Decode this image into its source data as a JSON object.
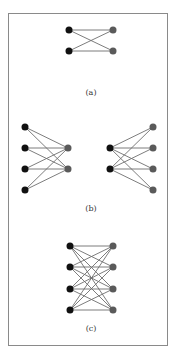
{
  "colors": {
    "left_node": "#111111",
    "right_node": "#5a5a5a",
    "edge": "#6e6e6e",
    "border": "#8a8a8a"
  },
  "panels": [
    {
      "label": "(a)",
      "label_pos": [
        91,
        95
      ],
      "left_nodes": [
        [
          69,
          30
        ],
        [
          69,
          51
        ]
      ],
      "right_nodes": [
        [
          113,
          30
        ],
        [
          113,
          51
        ]
      ],
      "edges": "complete"
    },
    {
      "label": "(b)",
      "label_pos": [
        91,
        211
      ],
      "subgraphs": [
        {
          "left_nodes": [
            [
              25,
              127
            ],
            [
              25,
              148
            ],
            [
              25,
              169
            ],
            [
              25,
              190
            ]
          ],
          "right_nodes": [
            [
              68,
              148
            ],
            [
              68,
              169
            ]
          ],
          "edges": "complete"
        },
        {
          "left_nodes": [
            [
              110,
              148
            ],
            [
              110,
              169
            ]
          ],
          "right_nodes": [
            [
              153,
              127
            ],
            [
              153,
              148
            ],
            [
              153,
              169
            ],
            [
              153,
              190
            ]
          ],
          "edges": "complete"
        }
      ]
    },
    {
      "label": "(c)",
      "label_pos": [
        91,
        331
      ],
      "left_nodes": [
        [
          70,
          246
        ],
        [
          70,
          267
        ],
        [
          70,
          289
        ],
        [
          70,
          310
        ]
      ],
      "right_nodes": [
        [
          113,
          246
        ],
        [
          113,
          267
        ],
        [
          113,
          289
        ],
        [
          113,
          310
        ]
      ],
      "edges": "complete"
    }
  ],
  "node_radius": 3.5
}
